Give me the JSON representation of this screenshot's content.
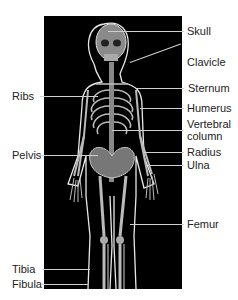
{
  "diagram": {
    "labels_right": [
      {
        "id": "skull",
        "text": "Skull"
      },
      {
        "id": "clavicle",
        "text": "Clavicle"
      },
      {
        "id": "sternum",
        "text": "Sternum"
      },
      {
        "id": "humerus",
        "text": "Humerus"
      },
      {
        "id": "vertebral1",
        "text": "Vertebral"
      },
      {
        "id": "vertebral2",
        "text": "column"
      },
      {
        "id": "radius",
        "text": "Radius"
      },
      {
        "id": "ulna",
        "text": "Ulna"
      },
      {
        "id": "femur",
        "text": "Femur"
      }
    ],
    "labels_left": [
      {
        "id": "ribs",
        "text": "Ribs"
      },
      {
        "id": "pelvis",
        "text": "Pelvis"
      },
      {
        "id": "tibia",
        "text": "Tibia"
      },
      {
        "id": "fibula",
        "text": "Fibula"
      }
    ],
    "colors": {
      "background": "#000000",
      "bone": "#d8d8d8",
      "leader": "#cfcfcf",
      "text": "#222222"
    }
  }
}
